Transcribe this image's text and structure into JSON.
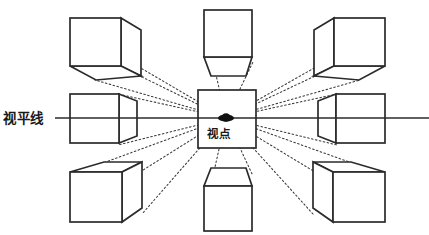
{
  "diagram": {
    "canvas": {
      "width": 429,
      "height": 235,
      "background": "#ffffff"
    },
    "labels": {
      "horizon_line": "视平线",
      "vanishing_point": "视点"
    },
    "colors": {
      "stroke": "#2b2b2b",
      "ray": "#3a3a3a",
      "horizon": "#2b2b2b",
      "vanishing_point_dot": "#111111",
      "face_fill": "#ffffff"
    },
    "vanishing_point": {
      "x": 226,
      "y": 118
    },
    "horizon": {
      "x1": 55,
      "x2": 429,
      "y": 118
    },
    "center_square": {
      "x": 198,
      "y": 90,
      "width": 58,
      "height": 58
    },
    "cubes": [
      {
        "name": "cube-top-left",
        "position": "top-left"
      },
      {
        "name": "cube-top-center",
        "position": "top-center"
      },
      {
        "name": "cube-top-right",
        "position": "top-right"
      },
      {
        "name": "cube-middle-left",
        "position": "middle-left"
      },
      {
        "name": "cube-middle-right",
        "position": "middle-right"
      },
      {
        "name": "cube-bottom-left",
        "position": "bottom-left"
      },
      {
        "name": "cube-bottom-center",
        "position": "bottom-center"
      },
      {
        "name": "cube-bottom-right",
        "position": "bottom-right"
      }
    ],
    "ray_count": 16
  }
}
